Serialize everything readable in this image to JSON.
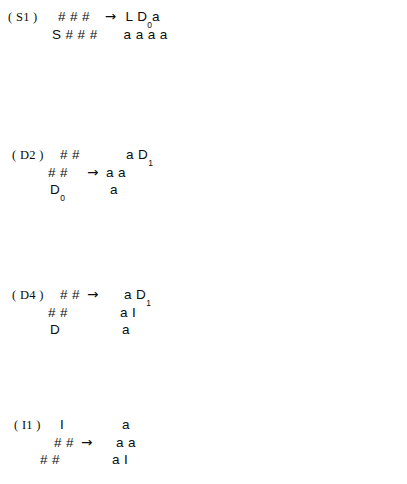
{
  "figure": {
    "arrow_glyph": "→",
    "rules": [
      {
        "id": "S1",
        "label": "( S1 )",
        "label_pos": {
          "x": 8,
          "y": 10
        },
        "body_pos": {
          "x": 52,
          "y": 8
        },
        "arrow_row": 1,
        "rows": 2,
        "lhs": [
          {
            "text": "# # #",
            "indent": 6
          },
          {
            "text": "S # # #",
            "indent": 0
          }
        ],
        "rhs": [
          {
            "html": "L D<sub>0</sub>a",
            "indent": 2
          },
          {
            "html": "a a a a",
            "indent": 0
          }
        ]
      },
      {
        "id": "D1",
        "label": "( D1 )",
        "label_pos": {
          "x": 212,
          "y": 10
        },
        "body_pos": {
          "x": 244,
          "y": 8
        },
        "arrow_row": 2,
        "rows": 3,
        "lhs": [
          {
            "text": "# #",
            "indent": 10
          },
          {
            "text": "# #",
            "indent": 0
          },
          {
            "html": "D<sub>0</sub>",
            "indent": 2
          }
        ],
        "rhs": [
          {
            "html": "I D",
            "indent": 22
          },
          {
            "html": "a a",
            "indent": 0
          },
          {
            "html": "a",
            "indent": 2
          }
        ]
      },
      {
        "id": "D2",
        "label": "( D2 )",
        "label_pos": {
          "x": 12,
          "y": 78
        },
        "body_pos": {
          "x": 48,
          "y": 76
        },
        "arrow_row": 2,
        "rows": 3,
        "lhs": [
          {
            "text": "# #",
            "indent": 12
          },
          {
            "text": "# #",
            "indent": 0
          },
          {
            "html": "D<sub>0</sub>",
            "indent": 2
          }
        ],
        "rhs": [
          {
            "html": "a D<sub>1</sub>",
            "indent": 20
          },
          {
            "html": "a a",
            "indent": 0
          },
          {
            "html": "a",
            "indent": 4
          }
        ]
      },
      {
        "id": "D3",
        "label": "( D3 )",
        "label_pos": {
          "x": 212,
          "y": 78
        },
        "body_pos": {
          "x": 248,
          "y": 76
        },
        "arrow_row": 2,
        "rows": 3,
        "lhs": [
          {
            "text": "# #",
            "indent": 10
          },
          {
            "text": "# #",
            "indent": 0
          },
          {
            "html": "D",
            "indent": 2
          }
        ],
        "rhs": [
          {
            "html": "I D",
            "indent": 20
          },
          {
            "html": "a I",
            "indent": 0
          },
          {
            "html": "a",
            "indent": 2
          }
        ]
      },
      {
        "id": "D4",
        "label": "( D4 )",
        "label_pos": {
          "x": 12,
          "y": 148
        },
        "body_pos": {
          "x": 48,
          "y": 146
        },
        "arrow_row": 1,
        "rows": 3,
        "lhs": [
          {
            "text": "# #",
            "indent": 12
          },
          {
            "text": "# #",
            "indent": 0
          },
          {
            "html": "D",
            "indent": 2
          }
        ],
        "rhs": [
          {
            "html": "a D<sub>1</sub>",
            "indent": 18
          },
          {
            "html": "a I",
            "indent": 14
          },
          {
            "html": "a",
            "indent": 16
          }
        ]
      },
      {
        "id": "D5",
        "label": "( D5 )",
        "label_pos": {
          "x": 212,
          "y": 146
        },
        "body_pos": {
          "x": 240,
          "y": 148
        },
        "arrow_row": 2,
        "rows": 3,
        "lhs": [
          {
            "text": "# # # # #",
            "indent": 0
          },
          {
            "text": "# # # #",
            "indent": 12
          },
          {
            "html": "D<sub>1</sub>",
            "indent": 32
          }
        ],
        "rhs": [
          {
            "html": "a a a a a",
            "indent": 0
          },
          {
            "html": "a a a R",
            "indent": 12
          },
          {
            "html": "a",
            "indent": 34
          }
        ]
      },
      {
        "id": "I1",
        "label": "( I1 )",
        "label_pos": {
          "x": 14,
          "y": 213
        },
        "body_pos": {
          "x": 40,
          "y": 211
        },
        "arrow_row": 2,
        "rows": 3,
        "lhs": [
          {
            "html": "I",
            "indent": 20
          },
          {
            "text": "# #",
            "indent": 14
          },
          {
            "text": "# #",
            "indent": 0
          }
        ],
        "rhs": [
          {
            "html": "a",
            "indent": 22
          },
          {
            "html": "a a",
            "indent": 16
          },
          {
            "html": "a I",
            "indent": 12
          }
        ]
      },
      {
        "id": "I2",
        "label": "( I2 )",
        "label_pos": {
          "x": 212,
          "y": 213
        },
        "body_pos": {
          "x": 240,
          "y": 211
        },
        "arrow_row": 2,
        "rows": 3,
        "lhs": [
          {
            "html": "I",
            "indent": 14
          },
          {
            "text": "# #",
            "indent": 0
          },
          {
            "text": "# #",
            "indent": 10
          }
        ],
        "rhs": [
          {
            "html": "a",
            "indent": 22
          },
          {
            "html": "a a",
            "indent": 14
          },
          {
            "html": "a a",
            "indent": 20
          }
        ]
      },
      {
        "id": "I3",
        "label": "( I3 )",
        "label_pos": {
          "x": 12,
          "y": 278
        },
        "body_pos": {
          "x": 46,
          "y": 276
        },
        "arrow_row": 2,
        "rows": 3,
        "lhs": [
          {
            "text": "# #",
            "indent": 12
          },
          {
            "text": "# #",
            "indent": 0
          },
          {
            "html": "I",
            "indent": 20
          }
        ],
        "rhs": [
          {
            "html": "I a",
            "indent": 20
          },
          {
            "html": "a a",
            "indent": 14
          },
          {
            "html": "a",
            "indent": 22
          }
        ]
      },
      {
        "id": "I4",
        "label": "( I4 )",
        "label_pos": {
          "x": 212,
          "y": 278
        },
        "body_pos": {
          "x": 240,
          "y": 276
        },
        "arrow_row": 2,
        "rows": 3,
        "lhs": [
          {
            "text": "# #",
            "indent": 0
          },
          {
            "text": "# #",
            "indent": 12
          },
          {
            "html": "I",
            "indent": 14
          }
        ],
        "rhs": [
          {
            "html": "a a",
            "indent": 10
          },
          {
            "html": "a a",
            "indent": 20
          },
          {
            "html": "a",
            "indent": 24
          }
        ]
      },
      {
        "id": "L1",
        "label": "( L1 )",
        "label_pos": {
          "x": 12,
          "y": 341
        },
        "body_pos": {
          "x": 48,
          "y": 343
        },
        "arrow_row": 2,
        "rows": 3,
        "lhs": [
          {
            "text": "# #",
            "indent": 0
          },
          {
            "text": "#",
            "indent": 0
          },
          {
            "html": "L",
            "indent": 0
          }
        ],
        "rhs": [
          {
            "html": "L a",
            "indent": 14
          },
          {
            "html": "a",
            "indent": 14
          },
          {
            "html": "a",
            "indent": 14
          }
        ]
      },
      {
        "id": "L2",
        "label": "( L2 )",
        "label_pos": {
          "x": 212,
          "y": 341
        },
        "body_pos": {
          "x": 248,
          "y": 343
        },
        "arrow_row": 2,
        "rows": 3,
        "lhs": [
          {
            "text": "#",
            "indent": 0
          },
          {
            "text": "# #",
            "indent": 0
          },
          {
            "html": "L",
            "indent": 0
          }
        ],
        "rhs": [
          {
            "html": "a",
            "indent": 14
          },
          {
            "html": "a a",
            "indent": 14
          },
          {
            "html": "a",
            "indent": 14
          }
        ]
      },
      {
        "id": "R1",
        "label": "( R1 )",
        "label_pos": {
          "x": 12,
          "y": 414
        },
        "body_pos": {
          "x": 44,
          "y": 412
        },
        "arrow_row": 2,
        "rows": 3,
        "lhs": [
          {
            "html": "R",
            "indent": 24
          },
          {
            "text": "# #",
            "indent": 12
          },
          {
            "text": "# # #",
            "indent": 0
          }
        ],
        "rhs": [
          {
            "html": "a",
            "indent": 30
          },
          {
            "html": "a a",
            "indent": 18
          },
          {
            "html": "a a R",
            "indent": 10
          }
        ]
      },
      {
        "id": "R2",
        "label": "( R2 )",
        "label_pos": {
          "x": 212,
          "y": 414
        },
        "body_pos": {
          "x": 244,
          "y": 412
        },
        "arrow_row": 2,
        "rows": 3,
        "lhs": [
          {
            "html": "R",
            "indent": 24
          },
          {
            "text": "# # #",
            "indent": 0
          },
          {
            "text": "# #",
            "indent": 14
          }
        ],
        "rhs": [
          {
            "html": "a",
            "indent": 26
          },
          {
            "html": "a a a",
            "indent": 6
          },
          {
            "html": "a a",
            "indent": 18
          }
        ]
      }
    ]
  }
}
